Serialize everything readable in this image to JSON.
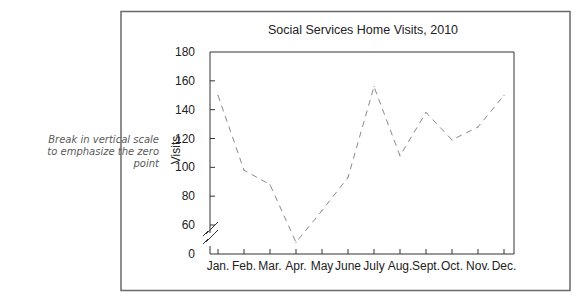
{
  "annotation": {
    "lines": [
      "Break in vertical scale",
      "to emphasize the zero",
      "point"
    ]
  },
  "chart_data": {
    "type": "line",
    "title": "Social Services Home Visits, 2010",
    "xlabel": "",
    "ylabel": "Visits",
    "categories": [
      "Jan.",
      "Feb.",
      "Mar.",
      "Apr.",
      "May",
      "June",
      "July",
      "Aug.",
      "Sept.",
      "Oct.",
      "Nov.",
      "Dec."
    ],
    "series": [
      {
        "name": "Visits",
        "values": [
          150,
          98,
          88,
          48,
          70,
          93,
          156,
          108,
          138,
          119,
          128,
          150
        ],
        "line_style": "dashed",
        "color": "#8a8a8a"
      }
    ],
    "yticks": [
      0,
      60,
      80,
      100,
      120,
      140,
      160,
      180
    ],
    "ylim": [
      40,
      180
    ],
    "axis_break": "between 0 and 60",
    "grid": false,
    "legend": "none"
  }
}
